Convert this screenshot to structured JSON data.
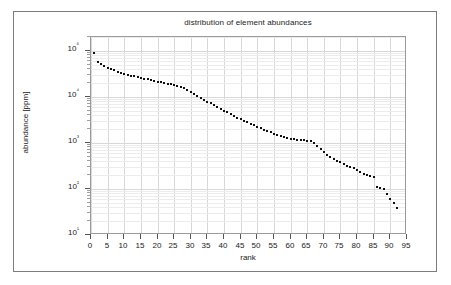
{
  "figure": {
    "title": "distribution of element abundances",
    "background_color": "#ffffff",
    "frame_color": "#7d7d7d",
    "axis_color": "#9a9a9a",
    "grid_color": "#d8d8d8",
    "marker_color": "#101010"
  },
  "chart_data": {
    "type": "scatter",
    "title": "distribution of element abundances",
    "xlabel": "rank",
    "ylabel": "abundance [ppm]",
    "xlim": [
      0,
      95
    ],
    "ylim": [
      10,
      200000
    ],
    "yscale": "log",
    "xscale": "linear",
    "grid": true,
    "legend": null,
    "x_ticks": [
      0,
      5,
      10,
      15,
      20,
      25,
      30,
      35,
      40,
      45,
      50,
      55,
      60,
      65,
      70,
      75,
      80,
      85,
      90,
      95
    ],
    "x_tick_labels": [
      "0",
      "5",
      "10",
      "15",
      "20",
      "25",
      "30",
      "35",
      "40",
      "45",
      "50",
      "55",
      "60",
      "65",
      "70",
      "75",
      "80",
      "85",
      "90",
      "95"
    ],
    "y_ticks": [
      10,
      100,
      1000,
      10000,
      100000
    ],
    "y_tick_labels": [
      "10¹",
      "10²",
      "10³",
      "10⁴",
      "10⁵"
    ],
    "marker": "square",
    "marker_size": 2,
    "n_points": 92,
    "x": [
      1,
      2,
      3,
      4,
      5,
      6,
      7,
      8,
      9,
      10,
      11,
      12,
      13,
      14,
      15,
      16,
      17,
      18,
      19,
      20,
      21,
      22,
      23,
      24,
      25,
      26,
      27,
      28,
      29,
      30,
      31,
      32,
      33,
      34,
      35,
      36,
      37,
      38,
      39,
      40,
      41,
      42,
      43,
      44,
      45,
      46,
      47,
      48,
      49,
      50,
      51,
      52,
      53,
      54,
      55,
      56,
      57,
      58,
      59,
      60,
      61,
      62,
      63,
      64,
      65,
      66,
      67,
      68,
      69,
      70,
      71,
      72,
      73,
      74,
      75,
      76,
      77,
      78,
      79,
      80,
      81,
      82,
      83,
      84,
      85,
      86,
      87,
      88,
      89,
      90,
      91,
      92
    ],
    "y": [
      92000,
      58000,
      51000,
      46500,
      43000,
      40000,
      37500,
      35500,
      33500,
      32000,
      30500,
      29000,
      28000,
      27000,
      26000,
      25000,
      24000,
      23000,
      22200,
      21500,
      20800,
      20000,
      19300,
      18600,
      17800,
      17000,
      16200,
      15400,
      14300,
      12800,
      11500,
      10300,
      9400,
      8600,
      7900,
      7200,
      6600,
      6000,
      5500,
      5000,
      4600,
      4200,
      3850,
      3550,
      3250,
      3000,
      2800,
      2600,
      2400,
      2250,
      2100,
      1950,
      1820,
      1700,
      1600,
      1500,
      1420,
      1340,
      1270,
      1230,
      1200,
      1180,
      1160,
      1150,
      1120,
      1090,
      1000,
      860,
      740,
      640,
      560,
      500,
      450,
      410,
      380,
      350,
      320,
      300,
      280,
      255,
      235,
      215,
      200,
      190,
      180,
      110,
      105,
      100,
      78,
      62,
      50,
      38,
      26
    ]
  }
}
